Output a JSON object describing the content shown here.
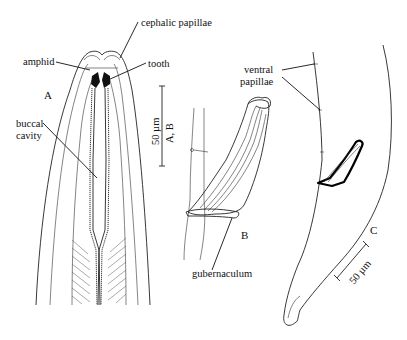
{
  "figure": {
    "panels": [
      {
        "id": "A",
        "label": "A",
        "subject": "anterior end"
      },
      {
        "id": "B",
        "label": "B",
        "subject": "spicule and gubernaculum"
      },
      {
        "id": "C",
        "label": "C",
        "subject": "male tail"
      }
    ],
    "annotations": {
      "cephalic_papillae": "cephalic papillae",
      "amphid": "amphid",
      "tooth": "tooth",
      "buccal_cavity_line1": "buccal",
      "buccal_cavity_line2": "cavity",
      "ventral_papillae_line1": "ventral",
      "ventral_papillae_line2": "papillae",
      "gubernaculum": "gubernaculum"
    },
    "scale_bars": [
      {
        "id": "scale-ab",
        "value": "50 µm",
        "applies_to": "A, B"
      },
      {
        "id": "scale-c",
        "value": "50 µm",
        "applies_to": "C"
      }
    ]
  }
}
